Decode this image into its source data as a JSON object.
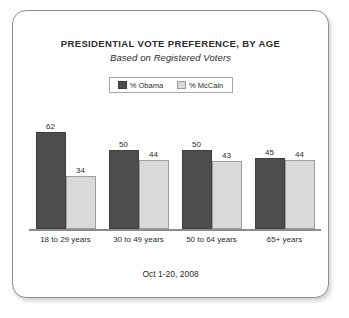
{
  "chart_data": {
    "type": "bar",
    "title": "PRESIDENTIAL VOTE PREFERENCE, BY AGE",
    "subtitle": "Based on Registered Voters",
    "footer": "Oct 1-20, 2008",
    "xlabel": "",
    "ylabel": "",
    "ylim": [
      0,
      70
    ],
    "grid": false,
    "legend_position": "top-center",
    "categories": [
      "18 to 29 years",
      "30 to 49 years",
      "50 to 64 years",
      "65+ years"
    ],
    "series": [
      {
        "name": "% Obama",
        "color": "#4d4d4d",
        "values": [
          62,
          50,
          50,
          45
        ]
      },
      {
        "name": "% McCain",
        "color": "#d9d9d9",
        "values": [
          34,
          44,
          43,
          44
        ]
      }
    ]
  },
  "legend": {
    "items": [
      {
        "label": "% Obama"
      },
      {
        "label": "% McCain"
      }
    ]
  },
  "colors": {
    "obama": "#4d4d4d",
    "mccain": "#d9d9d9",
    "frame_border": "#8e8e8e",
    "axis": "#8c8c8c",
    "text": "#2b2b2b"
  }
}
